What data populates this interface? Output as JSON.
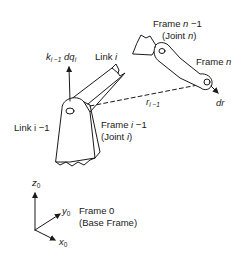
{
  "diagram": {
    "labels": {
      "frame_n_minus_1": "Frame n −1",
      "frame_n_minus_1_main": "Frame ",
      "frame_n_minus_1_var": "n",
      "frame_n_minus_1_rest": " −1",
      "joint_n_open": "(Joint ",
      "joint_n_var": "n",
      "joint_n_close": ")",
      "frame_n_main": "Frame ",
      "frame_n_var": "n",
      "k_base": "k",
      "k_sub": "i −1",
      "dq": " dq",
      "dq_sub": "i",
      "link_i_main": "Link ",
      "link_i_var": "i",
      "r_base": "r",
      "r_sub": "i −1",
      "dr": "dr",
      "link_i_minus_1": "Link i −1",
      "frame_i_minus_1_main": "Frame ",
      "frame_i_minus_1_var": "i",
      "frame_i_minus_1_rest": " −1",
      "joint_i_open": "(Joint ",
      "joint_i_var": "i",
      "joint_i_close": ")",
      "z0_base": "z",
      "z0_sub": "0",
      "y0_base": "y",
      "y0_sub": "0",
      "x0_base": "x",
      "x0_sub": "0",
      "frame_0": "Frame 0",
      "base_frame": "(Base Frame)"
    },
    "colors": {
      "ink": "#1a1a1a",
      "background": "#ffffff"
    }
  }
}
